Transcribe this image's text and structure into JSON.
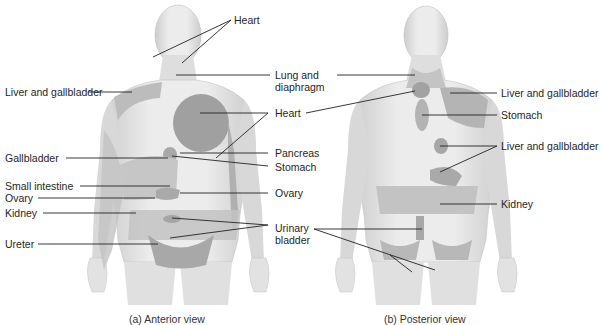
{
  "figure": {
    "anterior": {
      "caption": "(a) Anterior view",
      "labels_left": [
        {
          "id": "liver-gallbladder",
          "text": "Liver and gallbladder"
        },
        {
          "id": "gallbladder",
          "text": "Gallbladder"
        },
        {
          "id": "small-intestine",
          "text": "Small intestine"
        },
        {
          "id": "ovary",
          "text": "Ovary"
        },
        {
          "id": "kidney",
          "text": "Kidney"
        },
        {
          "id": "ureter",
          "text": "Ureter"
        }
      ],
      "labels_right": [
        {
          "id": "heart-top",
          "text": "Heart"
        },
        {
          "id": "lung-diaphragm",
          "text": "Lung and",
          "text2": "diaphragm"
        },
        {
          "id": "heart",
          "text": "Heart"
        },
        {
          "id": "pancreas",
          "text": "Pancreas"
        },
        {
          "id": "stomach",
          "text": "Stomach"
        },
        {
          "id": "ovary-right",
          "text": "Ovary"
        },
        {
          "id": "urinary-bladder",
          "text": "Urinary",
          "text2": "bladder"
        }
      ]
    },
    "posterior": {
      "caption": "(b) Posterior view",
      "labels_right": [
        {
          "id": "liver-gallbladder-upper",
          "text": "Liver and gallbladder"
        },
        {
          "id": "stomach",
          "text": "Stomach"
        },
        {
          "id": "liver-gallbladder-lower",
          "text": "Liver and gallbladder"
        },
        {
          "id": "kidney",
          "text": "Kidney"
        }
      ]
    },
    "colors": {
      "skin": "#e6e6e6",
      "skin_shade": "#cfcfcf",
      "region_light": "#b9b9b9",
      "region_dark": "#9a9a9a",
      "line": "#222222"
    }
  }
}
